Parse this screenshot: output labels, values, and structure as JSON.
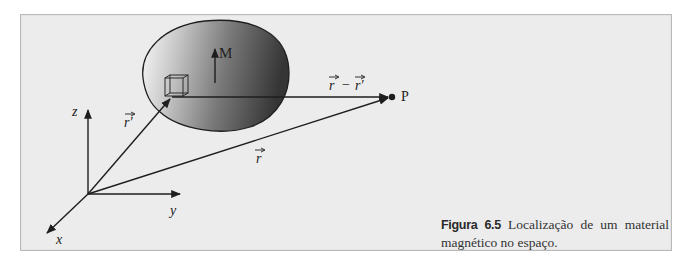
{
  "figure": {
    "number_label": "Figura 6.5",
    "caption_text": "Localização de um material magnético no espaço.",
    "colors": {
      "frame_background": "#ececec",
      "frame_border": "#b9b9b9",
      "body_dark": "#3a3a3a",
      "body_light": "#f5f5f5",
      "line": "#1e1e1e"
    }
  },
  "diagram": {
    "axes": {
      "x_label": "x",
      "y_label": "y",
      "z_label": "z"
    },
    "magnetization_label": "M",
    "point_label": "P",
    "vectors": {
      "source_position": "r′",
      "field_position": "r",
      "difference": "r − r′",
      "difference_left": "r",
      "difference_minus": "−",
      "difference_right": "r′"
    }
  }
}
